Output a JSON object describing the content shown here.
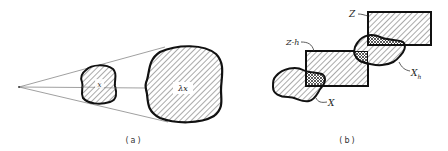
{
  "figure": {
    "panel_a": {
      "caption": "(a)",
      "small_set_label": "x",
      "large_set_label": "λx",
      "description": "Dilation of set x from a point by factor lambda"
    },
    "panel_b": {
      "caption": "(b)",
      "labels": {
        "Z": "Z",
        "Z_minus_h": "Z-h",
        "X": "X",
        "X_h": "X",
        "X_h_sub": "h"
      },
      "description": "Translation of structuring element Z by h and intersection with set X"
    }
  },
  "colors": {
    "stroke": "#111111",
    "hatch": "#555555",
    "construction_line": "#777777",
    "background": "#ffffff"
  }
}
